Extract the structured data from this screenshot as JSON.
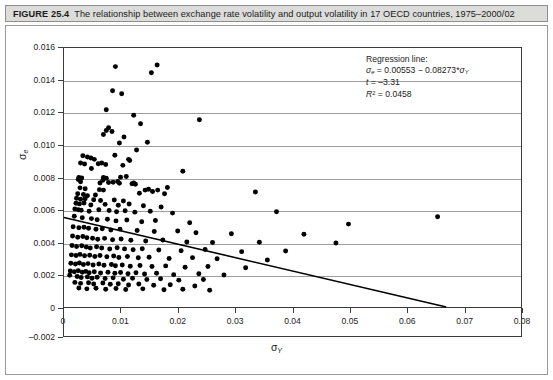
{
  "figure": {
    "number": "FIGURE 25.4",
    "caption": "The relationship between exchange rate volatility and output volatility in 17 OECD countries, 1975–2000/02"
  },
  "annotation": {
    "heading": "Regression line:",
    "equation": "σe = 0.00553 − 0.08273*σY",
    "equation_lhs": "σ",
    "equation_lhs_sub": "e",
    "equation_mid": " = 0.00553 − 0.08273*",
    "equation_rhs": "σ",
    "equation_rhs_sub": "Y",
    "t_label": "t",
    "t_value": " = –3.31",
    "r2_label": "R",
    "r2_sup": "2",
    "r2_value": " = 0.0458"
  },
  "axes": {
    "y_label_sigma": "σ",
    "y_label_sub": "e",
    "x_label_sigma": "σ",
    "x_label_sub": "Y",
    "y_ticks": [
      "0.016",
      "0.014",
      "0.012",
      "0.010",
      "0.008",
      "0.006",
      "0.004",
      "0.002",
      "0",
      "–0.002"
    ],
    "x_ticks": [
      "0",
      "0.01",
      "0.02",
      "0.03",
      "0.04",
      "0.05",
      "0.06",
      "0.07",
      "0.08"
    ]
  },
  "chart_data": {
    "type": "scatter",
    "title": "The relationship between exchange rate volatility and output volatility in 17 OECD countries, 1975–2000/02",
    "xlabel": "σY",
    "ylabel": "σe",
    "xlim": [
      0,
      0.08
    ],
    "ylim": [
      -0.002,
      0.016
    ],
    "xticks": [
      0,
      0.01,
      0.02,
      0.03,
      0.04,
      0.05,
      0.06,
      0.07,
      0.08
    ],
    "yticks": [
      -0.002,
      0,
      0.002,
      0.004,
      0.006,
      0.008,
      0.01,
      0.012,
      0.014,
      0.016
    ],
    "grid": "horizontal",
    "legend": "none",
    "regression": {
      "intercept": 0.00553,
      "slope": -0.08273,
      "t_statistic": -3.31,
      "r_squared": 0.0458,
      "x_start": 0.0,
      "x_end": 0.0669,
      "y_start": 0.00553,
      "y_end": 0.0
    },
    "series": [
      {
        "name": "OECD country-year observations",
        "marker": "filled-circle",
        "color": "#000000",
        "points": [
          [
            0.009,
            0.01485
          ],
          [
            0.0163,
            0.01495
          ],
          [
            0.0153,
            0.01447
          ],
          [
            0.0085,
            0.01336
          ],
          [
            0.0101,
            0.01318
          ],
          [
            0.0074,
            0.01219
          ],
          [
            0.0122,
            0.01185
          ],
          [
            0.0237,
            0.01157
          ],
          [
            0.0134,
            0.01132
          ],
          [
            0.0078,
            0.01107
          ],
          [
            0.0074,
            0.0109
          ],
          [
            0.0084,
            0.01084
          ],
          [
            0.0069,
            0.01065
          ],
          [
            0.0105,
            0.0105
          ],
          [
            0.0097,
            0.01013
          ],
          [
            0.0146,
            0.01018
          ],
          [
            0.0127,
            0.0097
          ],
          [
            0.0033,
            0.00935
          ],
          [
            0.0041,
            0.00927
          ],
          [
            0.0047,
            0.0092
          ],
          [
            0.0053,
            0.00912
          ],
          [
            0.0089,
            0.00938
          ],
          [
            0.0113,
            0.00912
          ],
          [
            0.0029,
            0.0089
          ],
          [
            0.0036,
            0.00884
          ],
          [
            0.006,
            0.00885
          ],
          [
            0.0066,
            0.0089
          ],
          [
            0.0073,
            0.0088
          ],
          [
            0.0103,
            0.00875
          ],
          [
            0.0115,
            0.00905
          ],
          [
            0.0048,
            0.00856
          ],
          [
            0.0208,
            0.00838
          ],
          [
            0.0026,
            0.008
          ],
          [
            0.0031,
            0.00797
          ],
          [
            0.0069,
            0.008
          ],
          [
            0.0074,
            0.00795
          ],
          [
            0.0099,
            0.00802
          ],
          [
            0.0109,
            0.00806
          ],
          [
            0.0025,
            0.00787
          ],
          [
            0.0068,
            0.00783
          ],
          [
            0.0029,
            0.00774
          ],
          [
            0.0063,
            0.00766
          ],
          [
            0.0078,
            0.00769
          ],
          [
            0.0086,
            0.0077
          ],
          [
            0.0094,
            0.00775
          ],
          [
            0.0097,
            0.00765
          ],
          [
            0.0119,
            0.00762
          ],
          [
            0.0122,
            0.00766
          ],
          [
            0.0125,
            0.00758
          ],
          [
            0.0181,
            0.00738
          ],
          [
            0.0028,
            0.00736
          ],
          [
            0.0037,
            0.00731
          ],
          [
            0.0062,
            0.00725
          ],
          [
            0.0069,
            0.00722
          ],
          [
            0.0142,
            0.00722
          ],
          [
            0.0148,
            0.00728
          ],
          [
            0.0155,
            0.00714
          ],
          [
            0.0164,
            0.00722
          ],
          [
            0.0024,
            0.007
          ],
          [
            0.0034,
            0.00695
          ],
          [
            0.0041,
            0.00688
          ],
          [
            0.0055,
            0.00692
          ],
          [
            0.0132,
            0.00703
          ],
          [
            0.0176,
            0.00699
          ],
          [
            0.0335,
            0.0071
          ],
          [
            0.0022,
            0.00672
          ],
          [
            0.0029,
            0.00665
          ],
          [
            0.0037,
            0.00669
          ],
          [
            0.0052,
            0.00662
          ],
          [
            0.0064,
            0.00658
          ],
          [
            0.0088,
            0.00661
          ],
          [
            0.0104,
            0.00655
          ],
          [
            0.0021,
            0.00641
          ],
          [
            0.0027,
            0.00637
          ],
          [
            0.0035,
            0.00643
          ],
          [
            0.0047,
            0.0063
          ],
          [
            0.0072,
            0.00634
          ],
          [
            0.0095,
            0.00628
          ],
          [
            0.0114,
            0.00636
          ],
          [
            0.0139,
            0.00626
          ],
          [
            0.017,
            0.00618
          ],
          [
            0.0019,
            0.00605
          ],
          [
            0.0025,
            0.00601
          ],
          [
            0.003,
            0.00598
          ],
          [
            0.0044,
            0.00592
          ],
          [
            0.0061,
            0.00601
          ],
          [
            0.0079,
            0.00596
          ],
          [
            0.0092,
            0.00588
          ],
          [
            0.0107,
            0.00594
          ],
          [
            0.0124,
            0.00586
          ],
          [
            0.0151,
            0.00592
          ],
          [
            0.019,
            0.0058
          ],
          [
            0.0372,
            0.00588
          ],
          [
            0.0498,
            0.00512
          ],
          [
            0.0654,
            0.00558
          ],
          [
            0.0018,
            0.0056
          ],
          [
            0.0032,
            0.00551
          ],
          [
            0.0048,
            0.00546
          ],
          [
            0.0058,
            0.00539
          ],
          [
            0.0076,
            0.00542
          ],
          [
            0.0091,
            0.00532
          ],
          [
            0.011,
            0.00538
          ],
          [
            0.0136,
            0.00527
          ],
          [
            0.016,
            0.00534
          ],
          [
            0.022,
            0.0052
          ],
          [
            0.0016,
            0.00496
          ],
          [
            0.0026,
            0.00489
          ],
          [
            0.0035,
            0.00493
          ],
          [
            0.0043,
            0.00486
          ],
          [
            0.0056,
            0.0048
          ],
          [
            0.0067,
            0.00484
          ],
          [
            0.0082,
            0.00476
          ],
          [
            0.0098,
            0.00481
          ],
          [
            0.0128,
            0.00472
          ],
          [
            0.0158,
            0.00466
          ],
          [
            0.0199,
            0.0047
          ],
          [
            0.0231,
            0.00459
          ],
          [
            0.0293,
            0.00452
          ],
          [
            0.042,
            0.0045
          ],
          [
            0.0015,
            0.00438
          ],
          [
            0.0024,
            0.00431
          ],
          [
            0.0033,
            0.00436
          ],
          [
            0.004,
            0.00428
          ],
          [
            0.005,
            0.00425
          ],
          [
            0.0059,
            0.00418
          ],
          [
            0.0071,
            0.00424
          ],
          [
            0.0085,
            0.00416
          ],
          [
            0.01,
            0.0042
          ],
          [
            0.0117,
            0.00412
          ],
          [
            0.0143,
            0.00408
          ],
          [
            0.0173,
            0.00414
          ],
          [
            0.0215,
            0.00402
          ],
          [
            0.026,
            0.00398
          ],
          [
            0.0342,
            0.004
          ],
          [
            0.0476,
            0.00396
          ],
          [
            0.0014,
            0.0038
          ],
          [
            0.0022,
            0.00374
          ],
          [
            0.0031,
            0.00378
          ],
          [
            0.0039,
            0.0037
          ],
          [
            0.0046,
            0.00365
          ],
          [
            0.0057,
            0.00372
          ],
          [
            0.0066,
            0.00364
          ],
          [
            0.008,
            0.00358
          ],
          [
            0.0093,
            0.00366
          ],
          [
            0.0106,
            0.00359
          ],
          [
            0.0121,
            0.00354
          ],
          [
            0.0137,
            0.0036
          ],
          [
            0.0166,
            0.00352
          ],
          [
            0.0205,
            0.00348
          ],
          [
            0.0247,
            0.00355
          ],
          [
            0.0311,
            0.00342
          ],
          [
            0.0388,
            0.00346
          ],
          [
            0.0013,
            0.00322
          ],
          [
            0.0021,
            0.00318
          ],
          [
            0.0028,
            0.00325
          ],
          [
            0.0036,
            0.00316
          ],
          [
            0.0045,
            0.0032
          ],
          [
            0.0054,
            0.00312
          ],
          [
            0.0063,
            0.00318
          ],
          [
            0.0075,
            0.0031
          ],
          [
            0.0087,
            0.00315
          ],
          [
            0.0096,
            0.00306
          ],
          [
            0.0111,
            0.00312
          ],
          [
            0.013,
            0.00304
          ],
          [
            0.0149,
            0.00308
          ],
          [
            0.0184,
            0.003
          ],
          [
            0.0225,
            0.00305
          ],
          [
            0.0268,
            0.00298
          ],
          [
            0.0356,
            0.0029
          ],
          [
            0.0012,
            0.0027
          ],
          [
            0.002,
            0.00265
          ],
          [
            0.0027,
            0.00272
          ],
          [
            0.0034,
            0.00263
          ],
          [
            0.0042,
            0.00268
          ],
          [
            0.0051,
            0.0026
          ],
          [
            0.0061,
            0.00266
          ],
          [
            0.007,
            0.00258
          ],
          [
            0.0083,
            0.00262
          ],
          [
            0.009,
            0.00255
          ],
          [
            0.0102,
            0.0026
          ],
          [
            0.0116,
            0.00252
          ],
          [
            0.0133,
            0.00256
          ],
          [
            0.0154,
            0.0025
          ],
          [
            0.0178,
            0.00254
          ],
          [
            0.0212,
            0.00246
          ],
          [
            0.0252,
            0.0025
          ],
          [
            0.0318,
            0.00242
          ],
          [
            0.0011,
            0.00222
          ],
          [
            0.0018,
            0.00218
          ],
          [
            0.0025,
            0.00224
          ],
          [
            0.0032,
            0.00215
          ],
          [
            0.0038,
            0.0022
          ],
          [
            0.0044,
            0.00212
          ],
          [
            0.0053,
            0.00218
          ],
          [
            0.0064,
            0.0021
          ],
          [
            0.0077,
            0.00215
          ],
          [
            0.0089,
            0.00208
          ],
          [
            0.0099,
            0.00213
          ],
          [
            0.0112,
            0.00206
          ],
          [
            0.0126,
            0.00211
          ],
          [
            0.0141,
            0.00204
          ],
          [
            0.0162,
            0.00208
          ],
          [
            0.0192,
            0.002
          ],
          [
            0.0236,
            0.00205
          ],
          [
            0.028,
            0.00198
          ],
          [
            0.001,
            0.00196
          ],
          [
            0.0023,
            0.00188
          ],
          [
            0.003,
            0.00182
          ],
          [
            0.0041,
            0.00186
          ],
          [
            0.0049,
            0.00178
          ],
          [
            0.0058,
            0.00184
          ],
          [
            0.0072,
            0.00176
          ],
          [
            0.0086,
            0.0018
          ],
          [
            0.0104,
            0.00172
          ],
          [
            0.012,
            0.00178
          ],
          [
            0.0145,
            0.0017
          ],
          [
            0.0169,
            0.00174
          ],
          [
            0.0201,
            0.00166
          ],
          [
            0.0244,
            0.0017
          ],
          [
            0.0019,
            0.00152
          ],
          [
            0.0029,
            0.00146
          ],
          [
            0.0043,
            0.0015
          ],
          [
            0.0052,
            0.00142
          ],
          [
            0.0068,
            0.00148
          ],
          [
            0.0081,
            0.0014
          ],
          [
            0.0095,
            0.00144
          ],
          [
            0.0113,
            0.00136
          ],
          [
            0.0131,
            0.00142
          ],
          [
            0.0157,
            0.00134
          ],
          [
            0.0186,
            0.00138
          ],
          [
            0.0229,
            0.0013
          ],
          [
            0.0026,
            0.00118
          ],
          [
            0.004,
            0.00112
          ],
          [
            0.0056,
            0.00116
          ],
          [
            0.0073,
            0.0011
          ],
          [
            0.0091,
            0.00114
          ],
          [
            0.0108,
            0.00108
          ],
          [
            0.0138,
            0.00112
          ],
          [
            0.0175,
            0.00106
          ],
          [
            0.0208,
            0.0011
          ],
          [
            0.0255,
            0.00104
          ]
        ]
      }
    ]
  }
}
